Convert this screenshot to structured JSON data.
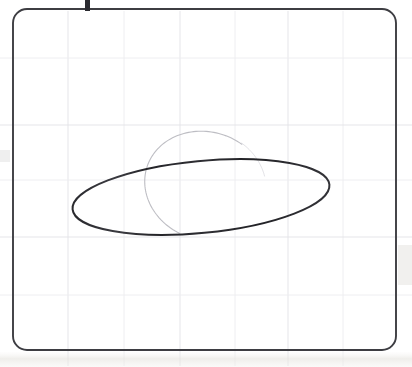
{
  "image": {
    "kind": "scanned-whiteboard-photo",
    "width": 412,
    "height": 367,
    "background_color": "#ffffff",
    "description": "Hand-drawn ellipse inside a rounded rectangular frame on faint graph paper"
  },
  "frame": {
    "label": "rounded-rectangle-border",
    "stroke_color": "#3d3d42",
    "stroke_width": 1.9,
    "corner_radius": 14,
    "x": 13,
    "y": 9,
    "width": 383,
    "height": 341
  },
  "grid": {
    "label": "faint-graph-grid",
    "line_color": "#ececef",
    "line_color_strong": "#e2e2e7",
    "vertical_positions": [
      68,
      124,
      180,
      235,
      288,
      343
    ],
    "horizontal_positions": [
      58,
      125,
      180,
      237,
      295
    ],
    "visible": true
  },
  "primary_shape": {
    "name": "hand-drawn-ellipse",
    "type": "ellipse",
    "stroke_color": "#2a2a2e",
    "stroke_width": 2.0,
    "center_x": 201,
    "center_y": 197,
    "radius_x": 129,
    "radius_y": 36,
    "rotation_deg": -5.5
  },
  "secondary_shape": {
    "name": "faint-overlapping-arc",
    "type": "arc",
    "stroke_color": "#b9b9c0",
    "stroke_width": 1.1,
    "center_x": 206,
    "center_y": 186,
    "radius_x": 62,
    "radius_y": 54,
    "rotation_deg": 18,
    "start_deg": 100,
    "end_deg": 290
  },
  "top_mark": {
    "name": "cropped-pen-mark",
    "color": "#2b2b30",
    "x": 85,
    "y": 0,
    "width": 5,
    "height": 11
  },
  "scan_artifacts": {
    "bottom_band": {
      "name": "scanner-shadow-band",
      "color": "#e8e6e1",
      "y": 352,
      "height": 15,
      "opacity": 0.75
    },
    "left_edge_smudge": {
      "color": "#efefef",
      "x": 0,
      "y": 150,
      "width": 10,
      "height": 12
    },
    "right_edge_smudge": {
      "color": "#f1f0ee",
      "x": 398,
      "y": 245,
      "width": 14,
      "height": 40
    }
  },
  "accessibility": {
    "alt_text": "A scanned photo of a hand-drawn dark ellipse on light graph paper, enclosed by a rounded rectangle frame, with a faint secondary arc crossing the ellipse near its center."
  }
}
